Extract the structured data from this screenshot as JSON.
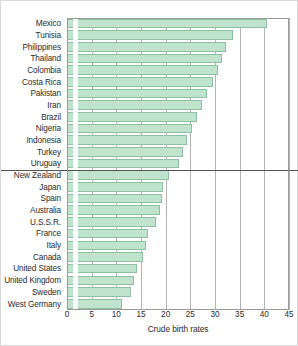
{
  "chart_data": {
    "type": "bar",
    "orientation": "horizontal",
    "title": "",
    "xlabel": "Crude birth rates",
    "ylabel": "",
    "xlim": [
      0,
      45
    ],
    "xticks": [
      0,
      5,
      10,
      15,
      20,
      25,
      30,
      35,
      40,
      45
    ],
    "xtick_labels": [
      "0",
      "5",
      "10",
      "15",
      "20",
      "25",
      "30",
      "35",
      "40",
      "45"
    ],
    "grid": "vertical",
    "legend": "none",
    "bar_fill_color": "#bfe3cd",
    "bar_edge_color": "#8fbfa2",
    "divider_after_category": "Uruguay",
    "divider_color": "#555555",
    "categories": [
      "Mexico",
      "Tunisia",
      "Philippines",
      "Thailand",
      "Colombia",
      "Costa Rica",
      "Pakistan",
      "Iran",
      "Brazil",
      "Nigeria",
      "Indonesia",
      "Turkey",
      "Uruguay",
      "New Zealand",
      "Japan",
      "Spain",
      "Australia",
      "U.S.S.R.",
      "France",
      "Italy",
      "Canada",
      "United States",
      "United Kingdom",
      "Sweden",
      "West Germany"
    ],
    "values": [
      40.6,
      33.6,
      32.3,
      31.5,
      30.7,
      29.5,
      28.4,
      27.4,
      26.4,
      25.4,
      24.4,
      23.6,
      22.8,
      20.6,
      19.4,
      19.2,
      18.9,
      18.0,
      16.5,
      16.0,
      15.5,
      14.2,
      13.6,
      13.0,
      11.2
    ]
  },
  "axis": {
    "x_label": "Crude birth rates"
  }
}
